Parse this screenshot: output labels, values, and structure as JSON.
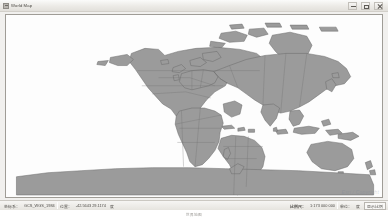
{
  "window": {
    "title": "World Map",
    "icon": "map-document-icon",
    "controls": {
      "minimize_label": "Minimize",
      "maximize_label": "Maximize",
      "close_label": "Close"
    }
  },
  "map": {
    "projection": "Plate Carree (Geographic)",
    "land_color": "#9b9b9b",
    "land_border_color": "#6e6e6e",
    "ocean_color": "#fdfdfd",
    "frame_border_color": "#9f9c96",
    "watermark": "Esri / Copyright"
  },
  "statusbar": {
    "left_label": "坐标系：",
    "left_value": "GCS_WGS_1984",
    "coords_label": "位置：",
    "coords_value": "-42.5643 29.1174",
    "coords_unit": "度",
    "scale_label": "比例尺：",
    "scale_value": "1:173 000 000",
    "units_label": "单位：",
    "units_value": "度",
    "rightmost_value": "显示比例"
  },
  "footer": {
    "caption": "世界地图"
  }
}
